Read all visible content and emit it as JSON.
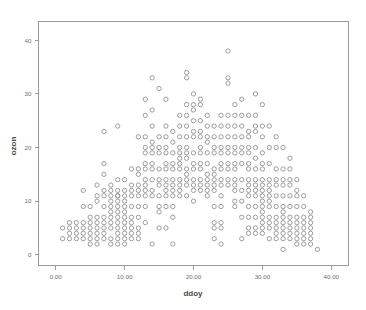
{
  "chart_data": {
    "type": "scatter",
    "title": "",
    "xlabel": "ddoy",
    "ylabel": "ozon",
    "xlim": [
      -2.5,
      42.5
    ],
    "ylim": [
      -2.0,
      43.5
    ],
    "xticks": [
      0,
      10,
      20,
      30,
      40
    ],
    "xtick_labels": [
      "0.00",
      "10.00",
      "20.00",
      "30.00",
      "40.00"
    ],
    "yticks": [
      0,
      10,
      20,
      30,
      40
    ],
    "ytick_labels": [
      "0",
      "10",
      "20",
      "30",
      "40"
    ],
    "grid": false,
    "legend": "none",
    "marker": "open-circle",
    "marker_color": "#8d8d8d",
    "frame_color": "#9a9a9a",
    "background": "#ffffff",
    "n_points": 404,
    "points": [
      [
        1,
        5
      ],
      [
        1,
        3
      ],
      [
        2,
        6
      ],
      [
        2,
        5
      ],
      [
        2,
        4
      ],
      [
        2,
        3
      ],
      [
        3,
        6
      ],
      [
        3,
        5
      ],
      [
        3,
        4
      ],
      [
        3,
        3
      ],
      [
        4,
        12
      ],
      [
        4,
        9
      ],
      [
        4,
        6
      ],
      [
        4,
        5
      ],
      [
        4,
        4
      ],
      [
        4,
        3
      ],
      [
        5,
        9
      ],
      [
        5,
        7
      ],
      [
        5,
        6
      ],
      [
        5,
        5
      ],
      [
        5,
        3
      ],
      [
        5,
        2
      ],
      [
        6,
        13
      ],
      [
        6,
        11
      ],
      [
        6,
        10
      ],
      [
        6,
        6
      ],
      [
        6,
        5
      ],
      [
        6,
        4
      ],
      [
        6,
        3
      ],
      [
        6,
        2
      ],
      [
        7,
        23
      ],
      [
        7,
        17
      ],
      [
        7,
        15
      ],
      [
        7,
        12
      ],
      [
        7,
        11
      ],
      [
        7,
        9
      ],
      [
        7,
        6
      ],
      [
        7,
        5
      ],
      [
        7,
        4
      ],
      [
        7,
        3
      ],
      [
        8,
        13
      ],
      [
        8,
        12
      ],
      [
        8,
        11
      ],
      [
        8,
        10
      ],
      [
        8,
        9
      ],
      [
        8,
        8
      ],
      [
        8,
        7
      ],
      [
        8,
        6
      ],
      [
        8,
        5
      ],
      [
        8,
        3
      ],
      [
        8,
        2
      ],
      [
        9,
        24
      ],
      [
        9,
        14
      ],
      [
        9,
        12
      ],
      [
        9,
        11
      ],
      [
        9,
        10
      ],
      [
        9,
        9
      ],
      [
        9,
        8
      ],
      [
        9,
        7
      ],
      [
        9,
        6
      ],
      [
        9,
        5
      ],
      [
        9,
        4
      ],
      [
        9,
        3
      ],
      [
        9,
        2
      ],
      [
        10,
        14
      ],
      [
        10,
        12
      ],
      [
        10,
        11
      ],
      [
        10,
        10
      ],
      [
        10,
        9
      ],
      [
        10,
        8
      ],
      [
        10,
        7
      ],
      [
        10,
        6
      ],
      [
        10,
        5
      ],
      [
        10,
        3
      ],
      [
        10,
        2
      ],
      [
        11,
        16
      ],
      [
        11,
        13
      ],
      [
        11,
        12
      ],
      [
        11,
        9
      ],
      [
        11,
        7
      ],
      [
        11,
        6
      ],
      [
        11,
        5
      ],
      [
        11,
        4
      ],
      [
        11,
        3
      ],
      [
        12,
        22
      ],
      [
        12,
        16
      ],
      [
        12,
        15
      ],
      [
        12,
        13
      ],
      [
        12,
        12
      ],
      [
        12,
        11
      ],
      [
        12,
        9
      ],
      [
        12,
        7
      ],
      [
        12,
        4
      ],
      [
        12,
        3
      ],
      [
        13,
        29
      ],
      [
        13,
        26
      ],
      [
        13,
        22
      ],
      [
        13,
        20
      ],
      [
        13,
        19
      ],
      [
        13,
        17
      ],
      [
        13,
        16
      ],
      [
        13,
        14
      ],
      [
        13,
        12
      ],
      [
        13,
        11
      ],
      [
        13,
        9
      ],
      [
        13,
        6
      ],
      [
        14,
        33
      ],
      [
        14,
        27
      ],
      [
        14,
        24
      ],
      [
        14,
        21
      ],
      [
        14,
        20
      ],
      [
        14,
        19
      ],
      [
        14,
        16
      ],
      [
        14,
        14
      ],
      [
        14,
        12
      ],
      [
        14,
        11
      ],
      [
        14,
        2
      ],
      [
        15,
        31
      ],
      [
        15,
        22
      ],
      [
        15,
        20
      ],
      [
        15,
        19
      ],
      [
        15,
        16
      ],
      [
        15,
        14
      ],
      [
        15,
        13
      ],
      [
        15,
        11
      ],
      [
        15,
        9
      ],
      [
        15,
        8
      ],
      [
        15,
        5
      ],
      [
        16,
        29
      ],
      [
        16,
        24
      ],
      [
        16,
        22
      ],
      [
        16,
        20
      ],
      [
        16,
        19
      ],
      [
        16,
        16
      ],
      [
        16,
        14
      ],
      [
        16,
        13
      ],
      [
        16,
        12
      ],
      [
        16,
        11
      ],
      [
        16,
        9
      ],
      [
        16,
        5
      ],
      [
        17,
        23
      ],
      [
        17,
        21
      ],
      [
        17,
        19
      ],
      [
        17,
        17
      ],
      [
        17,
        16
      ],
      [
        17,
        14
      ],
      [
        17,
        13
      ],
      [
        17,
        12
      ],
      [
        17,
        11
      ],
      [
        17,
        7
      ],
      [
        17,
        2
      ],
      [
        18,
        26
      ],
      [
        18,
        24
      ],
      [
        18,
        22
      ],
      [
        18,
        20
      ],
      [
        18,
        19
      ],
      [
        18,
        18
      ],
      [
        18,
        17
      ],
      [
        18,
        16
      ],
      [
        18,
        14
      ],
      [
        18,
        13
      ],
      [
        18,
        12
      ],
      [
        19,
        34
      ],
      [
        19,
        33
      ],
      [
        19,
        28
      ],
      [
        19,
        26
      ],
      [
        19,
        24
      ],
      [
        19,
        22
      ],
      [
        19,
        20
      ],
      [
        19,
        19
      ],
      [
        19,
        18
      ],
      [
        19,
        16
      ],
      [
        19,
        15
      ],
      [
        19,
        14
      ],
      [
        19,
        13
      ],
      [
        20,
        30
      ],
      [
        20,
        28
      ],
      [
        20,
        27
      ],
      [
        20,
        25
      ],
      [
        20,
        23
      ],
      [
        20,
        22
      ],
      [
        20,
        19
      ],
      [
        20,
        17
      ],
      [
        20,
        16
      ],
      [
        20,
        14
      ],
      [
        20,
        13
      ],
      [
        20,
        10
      ],
      [
        21,
        29
      ],
      [
        21,
        28
      ],
      [
        21,
        25
      ],
      [
        21,
        23
      ],
      [
        21,
        22
      ],
      [
        21,
        20
      ],
      [
        21,
        19
      ],
      [
        21,
        17
      ],
      [
        21,
        16
      ],
      [
        21,
        14
      ],
      [
        21,
        13
      ],
      [
        22,
        26
      ],
      [
        22,
        24
      ],
      [
        22,
        22
      ],
      [
        22,
        21
      ],
      [
        22,
        19
      ],
      [
        22,
        17
      ],
      [
        22,
        15
      ],
      [
        22,
        14
      ],
      [
        22,
        13
      ],
      [
        22,
        12
      ],
      [
        23,
        24
      ],
      [
        23,
        22
      ],
      [
        23,
        20
      ],
      [
        23,
        19
      ],
      [
        23,
        16
      ],
      [
        23,
        15
      ],
      [
        23,
        14
      ],
      [
        23,
        13
      ],
      [
        23,
        12
      ],
      [
        23,
        9
      ],
      [
        23,
        6
      ],
      [
        23,
        5
      ],
      [
        23,
        3
      ],
      [
        24,
        26
      ],
      [
        24,
        24
      ],
      [
        24,
        22
      ],
      [
        24,
        20
      ],
      [
        24,
        19
      ],
      [
        24,
        17
      ],
      [
        24,
        16
      ],
      [
        24,
        14
      ],
      [
        24,
        13
      ],
      [
        24,
        9
      ],
      [
        24,
        6
      ],
      [
        24,
        5
      ],
      [
        24,
        2
      ],
      [
        25,
        38
      ],
      [
        25,
        33
      ],
      [
        25,
        32
      ],
      [
        25,
        26
      ],
      [
        25,
        24
      ],
      [
        25,
        22
      ],
      [
        25,
        20
      ],
      [
        25,
        19
      ],
      [
        25,
        17
      ],
      [
        25,
        16
      ],
      [
        25,
        13
      ],
      [
        26,
        28
      ],
      [
        26,
        26
      ],
      [
        26,
        24
      ],
      [
        26,
        22
      ],
      [
        26,
        20
      ],
      [
        26,
        19
      ],
      [
        26,
        17
      ],
      [
        26,
        16
      ],
      [
        26,
        14
      ],
      [
        26,
        13
      ],
      [
        26,
        12
      ],
      [
        26,
        10
      ],
      [
        27,
        29
      ],
      [
        27,
        26
      ],
      [
        27,
        24
      ],
      [
        27,
        22
      ],
      [
        27,
        20
      ],
      [
        27,
        19
      ],
      [
        27,
        17
      ],
      [
        27,
        14
      ],
      [
        27,
        12
      ],
      [
        27,
        10
      ],
      [
        27,
        7
      ],
      [
        27,
        3
      ],
      [
        28,
        26
      ],
      [
        28,
        23
      ],
      [
        28,
        22
      ],
      [
        28,
        20
      ],
      [
        28,
        19
      ],
      [
        28,
        17
      ],
      [
        28,
        16
      ],
      [
        28,
        14
      ],
      [
        28,
        12
      ],
      [
        28,
        11
      ],
      [
        28,
        9
      ],
      [
        28,
        7
      ],
      [
        28,
        5
      ],
      [
        28,
        4
      ],
      [
        29,
        30
      ],
      [
        29,
        26
      ],
      [
        29,
        24
      ],
      [
        29,
        23
      ],
      [
        29,
        20
      ],
      [
        29,
        18
      ],
      [
        29,
        16
      ],
      [
        29,
        14
      ],
      [
        29,
        12
      ],
      [
        29,
        11
      ],
      [
        29,
        9
      ],
      [
        29,
        7
      ],
      [
        29,
        5
      ],
      [
        29,
        4
      ],
      [
        30,
        28
      ],
      [
        30,
        24
      ],
      [
        30,
        22
      ],
      [
        30,
        19
      ],
      [
        30,
        17
      ],
      [
        30,
        16
      ],
      [
        30,
        14
      ],
      [
        30,
        13
      ],
      [
        30,
        12
      ],
      [
        30,
        11
      ],
      [
        30,
        9
      ],
      [
        30,
        8
      ],
      [
        30,
        7
      ],
      [
        30,
        6
      ],
      [
        30,
        5
      ],
      [
        30,
        4
      ],
      [
        31,
        24
      ],
      [
        31,
        20
      ],
      [
        31,
        17
      ],
      [
        31,
        14
      ],
      [
        31,
        12
      ],
      [
        31,
        11
      ],
      [
        31,
        10
      ],
      [
        31,
        9
      ],
      [
        31,
        7
      ],
      [
        31,
        6
      ],
      [
        31,
        5
      ],
      [
        31,
        3
      ],
      [
        32,
        22
      ],
      [
        32,
        20
      ],
      [
        32,
        16
      ],
      [
        32,
        14
      ],
      [
        32,
        13
      ],
      [
        32,
        11
      ],
      [
        32,
        9
      ],
      [
        32,
        7
      ],
      [
        32,
        6
      ],
      [
        32,
        5
      ],
      [
        32,
        4
      ],
      [
        32,
        3
      ],
      [
        33,
        20
      ],
      [
        33,
        16
      ],
      [
        33,
        14
      ],
      [
        33,
        13
      ],
      [
        33,
        11
      ],
      [
        33,
        9
      ],
      [
        33,
        7
      ],
      [
        33,
        6
      ],
      [
        33,
        5
      ],
      [
        33,
        4
      ],
      [
        33,
        3
      ],
      [
        33,
        1
      ],
      [
        34,
        18
      ],
      [
        34,
        16
      ],
      [
        34,
        14
      ],
      [
        34,
        13
      ],
      [
        34,
        11
      ],
      [
        34,
        9
      ],
      [
        34,
        7
      ],
      [
        34,
        6
      ],
      [
        34,
        5
      ],
      [
        34,
        4
      ],
      [
        34,
        3
      ],
      [
        35,
        14
      ],
      [
        35,
        12
      ],
      [
        35,
        9
      ],
      [
        35,
        7
      ],
      [
        35,
        6
      ],
      [
        35,
        5
      ],
      [
        35,
        4
      ],
      [
        35,
        3
      ],
      [
        35,
        2
      ],
      [
        36,
        11
      ],
      [
        36,
        9
      ],
      [
        36,
        7
      ],
      [
        36,
        6
      ],
      [
        36,
        5
      ],
      [
        36,
        4
      ],
      [
        36,
        3
      ],
      [
        36,
        2
      ],
      [
        37,
        8
      ],
      [
        37,
        7
      ],
      [
        37,
        6
      ],
      [
        37,
        5
      ],
      [
        37,
        4
      ],
      [
        37,
        3
      ],
      [
        37,
        2
      ],
      [
        38,
        1
      ],
      [
        5,
        4
      ],
      [
        6,
        7
      ],
      [
        7,
        7
      ],
      [
        9,
        11
      ],
      [
        10,
        4
      ],
      [
        11,
        11
      ],
      [
        12,
        5
      ],
      [
        13,
        13
      ],
      [
        14,
        17
      ],
      [
        16,
        17
      ],
      [
        17,
        9
      ],
      [
        18,
        11
      ],
      [
        19,
        11
      ],
      [
        20,
        12
      ],
      [
        21,
        12
      ],
      [
        22,
        11
      ],
      [
        24,
        11
      ],
      [
        25,
        14
      ],
      [
        26,
        9
      ],
      [
        28,
        13
      ],
      [
        29,
        13
      ],
      [
        30,
        10
      ],
      [
        31,
        13
      ],
      [
        33,
        8
      ],
      [
        35,
        11
      ]
    ]
  }
}
